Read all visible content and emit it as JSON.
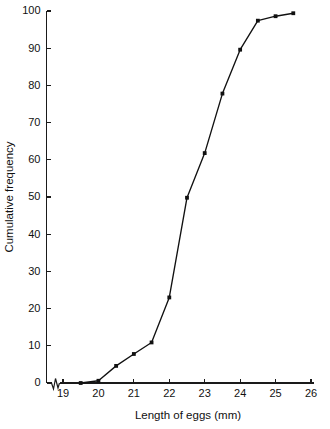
{
  "chart_data": {
    "type": "line",
    "title": "",
    "subtitle": "",
    "xlabel": "Length of eggs (mm)",
    "ylabel": "Cumulative frequency",
    "xlim": [
      18.6,
      26.0
    ],
    "ylim": [
      0,
      100
    ],
    "xticks": [
      19,
      20,
      21,
      22,
      23,
      24,
      25,
      26
    ],
    "xticklabels": [
      "19",
      "20",
      "21",
      "22",
      "23",
      "24",
      "25",
      "26"
    ],
    "yticks": [
      0,
      10,
      20,
      30,
      40,
      50,
      60,
      70,
      80,
      90,
      100
    ],
    "yticklabels": [
      "0",
      "10",
      "20",
      "30",
      "40",
      "50",
      "60",
      "70",
      "80",
      "90",
      "100"
    ],
    "grid": false,
    "legend": null,
    "axis_break": {
      "axis": "x",
      "present": true,
      "note": "zigzag break between origin and first tick"
    },
    "marker": "square",
    "line_color": "#111111",
    "marker_color": "#111111",
    "x": [
      19.5,
      20.0,
      20.5,
      21.0,
      21.5,
      22.0,
      22.5,
      23.0,
      23.5,
      24.0,
      24.5,
      25.0,
      25.5
    ],
    "values": [
      0.0,
      0.6,
      4.6,
      7.8,
      10.9,
      23.0,
      49.8,
      61.8,
      77.8,
      89.6,
      97.4,
      98.6,
      99.4
    ],
    "series": [
      {
        "name": "Cumulative frequency",
        "x": [
          19.5,
          20.0,
          20.5,
          21.0,
          21.5,
          22.0,
          22.5,
          23.0,
          23.5,
          24.0,
          24.5,
          25.0,
          25.5
        ],
        "values": [
          0.0,
          0.6,
          4.6,
          7.8,
          10.9,
          23.0,
          49.8,
          61.8,
          77.8,
          89.6,
          97.4,
          98.6,
          99.4
        ]
      }
    ]
  }
}
